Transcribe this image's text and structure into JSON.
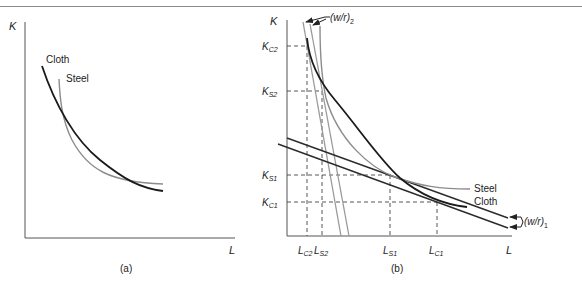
{
  "colors": {
    "cloth": "#1a1a1a",
    "steel": "#8c8c8c",
    "isocost": "#2b2b2b",
    "isocost_steep": "#9a9a9a",
    "axis": "#555555",
    "dash": "#444444"
  },
  "panel_a": {
    "caption": "(a)",
    "y_axis_label": "K",
    "x_axis_label": "L",
    "curves": [
      {
        "name": "Cloth",
        "label": "Cloth",
        "style": "dark"
      },
      {
        "name": "Steel",
        "label": "Steel",
        "style": "gray"
      }
    ]
  },
  "panel_b": {
    "caption": "(b)",
    "y_axis_label": "K",
    "x_axis_label": "L",
    "curve_labels": {
      "steel": "Steel",
      "cloth": "Cloth"
    },
    "isocost_labels": {
      "steep": "(w/r)",
      "steep_sub": "2",
      "flat": "(w/r)",
      "flat_sub": "1"
    },
    "y_ticks": [
      {
        "main": "K",
        "sub": "C2"
      },
      {
        "main": "K",
        "sub": "S2"
      },
      {
        "main": "K",
        "sub": "S1"
      },
      {
        "main": "K",
        "sub": "C1"
      }
    ],
    "x_ticks": [
      {
        "main": "L",
        "sub": "C2"
      },
      {
        "main": "L",
        "sub": "S2"
      },
      {
        "main": "L",
        "sub": "S1"
      },
      {
        "main": "L",
        "sub": "C1"
      }
    ]
  }
}
